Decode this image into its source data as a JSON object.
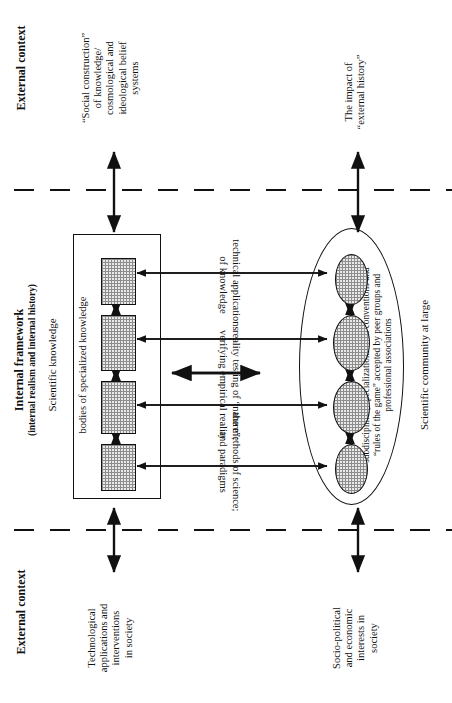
{
  "diagram": {
    "title_top": "External context",
    "title_middle_bold": "Internal framework",
    "title_middle_sub": "(internal realism and internal history)",
    "title_bottom": "External context",
    "zones": {
      "top_label": "External context",
      "bottom_label": "External context",
      "internal_label_bold": "Internal framework",
      "internal_label_paren": "(internal realism and internal history)"
    },
    "top_items": [
      {
        "name": "social-construction",
        "lines": [
          "“Social construction”",
          "of knowledge/",
          "cosmological and",
          "ideological belief",
          "systems"
        ],
        "text": "“Social construction” of knowledge/ cosmological and ideological belief systems"
      },
      {
        "name": "impact-external-history",
        "lines": [
          "The impact of",
          "“external history”"
        ],
        "text": "The impact of “external history”"
      }
    ],
    "bottom_items": [
      {
        "name": "technological-applications",
        "lines": [
          "Technological",
          "applications and",
          "interventions",
          "in society"
        ],
        "text": "Technological applications and interventions in society"
      },
      {
        "name": "socio-political-interests",
        "lines": [
          "Socio-political",
          "and economic",
          "interests in",
          "society"
        ],
        "text": "Socio-political and economic interests in society"
      }
    ],
    "left_cluster": {
      "heading": "Scientific knowledge",
      "sub_heading": "bodies of specialized knowledge",
      "node_count": 4
    },
    "right_cluster": {
      "heading": "Scientific community at large",
      "sub_heading_lines": [
        "subdisciplines, specializations with conventions and",
        "“rules of the game” accepted by peer groups and",
        "professional associations"
      ],
      "sub_heading": "subdisciplines, specializations with conventions and “rules of the game” accepted by peer groups and professional associations",
      "node_count": 4
    },
    "connector_labels": [
      {
        "name": "technical-applications-of-knowledge",
        "lines": [
          "technical applications",
          "of knowledge"
        ],
        "text": "technical applications of knowledge"
      },
      {
        "name": "reality-testing-of-nature",
        "lines": [
          "reality testing of “nature”;",
          "verifying empirical reality"
        ],
        "text": "reality testing of “nature”; verifying empirical reality"
      },
      {
        "name": "methods-of-science-and-paradigms",
        "lines": [
          "the methods of science;",
          "and paradigms"
        ],
        "text": "the methods of science; and paradigms"
      }
    ],
    "colors": {
      "line": "#111111",
      "hatch_fill": "#e9e9e9",
      "hatch_stroke": "#8d8d8d",
      "background": "#ffffff"
    }
  }
}
